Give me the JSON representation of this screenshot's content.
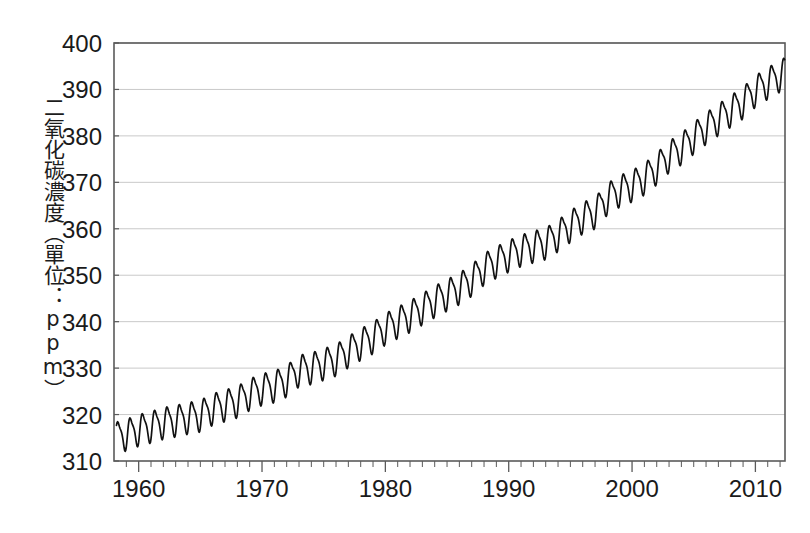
{
  "chart_data": {
    "type": "line",
    "title": "",
    "subtitle": "",
    "xlabel": "",
    "ylabel": "二氧化碳濃度（單位：ppm）",
    "xlim": [
      1958.0,
      2012.4
    ],
    "ylim": [
      310,
      400
    ],
    "y_ticks": [
      310,
      320,
      330,
      340,
      350,
      360,
      370,
      380,
      390,
      400
    ],
    "y_tick_labels": [
      "310",
      "320",
      "330",
      "340",
      "350",
      "360",
      "370",
      "380",
      "390",
      "400"
    ],
    "x_major_ticks": [
      1960,
      1970,
      1980,
      1990,
      2000,
      2010
    ],
    "x_major_tick_labels": [
      "1960",
      "1970",
      "1980",
      "1990",
      "2000",
      "2010"
    ],
    "x_minor_tick_step": 1,
    "grid": "horizontal-only",
    "legend": "none",
    "line_color": "#111111",
    "grid_color": "#c9c9c9",
    "frame_color": "#5a5a5a",
    "background_color": "#ffffff",
    "series": [
      {
        "name": "Atmospheric CO2 concentration (Mauna Loa)",
        "description": "Monthly mean CO2 with seasonal oscillation superimposed on a rising trend",
        "seasonal_amplitude_ppm": 6.2,
        "x": [
          1958.2,
          1959,
          1960,
          1961,
          1962,
          1963,
          1964,
          1965,
          1966,
          1967,
          1968,
          1969,
          1970,
          1971,
          1972,
          1973,
          1974,
          1975,
          1976,
          1977,
          1978,
          1979,
          1980,
          1981,
          1982,
          1983,
          1984,
          1985,
          1986,
          1987,
          1988,
          1989,
          1990,
          1991,
          1992,
          1993,
          1994,
          1995,
          1996,
          1997,
          1998,
          1999,
          2000,
          2001,
          2002,
          2003,
          2004,
          2005,
          2006,
          2007,
          2008,
          2009,
          2010,
          2011,
          2012.4
        ],
        "annual_mean_values": [
          315.3,
          315.9,
          316.9,
          317.6,
          318.4,
          318.9,
          319.5,
          320.0,
          321.4,
          322.2,
          323.0,
          324.6,
          325.7,
          326.3,
          327.5,
          329.7,
          330.2,
          331.1,
          332.0,
          333.8,
          335.4,
          336.8,
          338.7,
          340.1,
          341.4,
          343.0,
          344.6,
          346.0,
          347.4,
          349.2,
          351.6,
          353.1,
          354.4,
          355.6,
          356.4,
          357.1,
          358.8,
          360.8,
          362.6,
          363.7,
          366.7,
          368.4,
          369.5,
          371.0,
          373.2,
          375.8,
          377.5,
          379.8,
          381.9,
          383.8,
          385.6,
          387.4,
          389.9,
          391.6,
          393.8
        ]
      }
    ]
  },
  "axis": {
    "y_label_text": "二氧化碳濃度（單位：ppm）"
  }
}
